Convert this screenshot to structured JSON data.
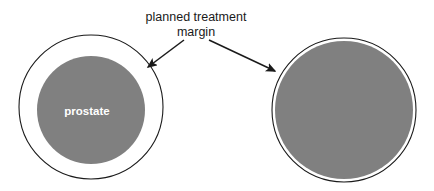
{
  "figure": {
    "background_color": "#ffffff",
    "annotation": {
      "line1": "planned treatment",
      "line2": "margin",
      "color": "#1a1a1a"
    },
    "labels": {
      "prostate": "prostate",
      "prostate_color": "#ffffff"
    },
    "colors": {
      "organ_fill": "#808080",
      "margin_fill": "#ffffff",
      "outline": "#1a1a1a"
    },
    "shapes": {
      "left": {
        "name": "large planned treatment margin around prostate",
        "outer_cx": 91,
        "outer_cy": 107,
        "outer_r": 72,
        "inner_cx": 91,
        "inner_cy": 110,
        "inner_r": 54
      },
      "right": {
        "name": "tight planned treatment margin around prostate",
        "outer_cx": 344,
        "outer_cy": 110,
        "outer_r": 72,
        "inner_cx": 344,
        "inner_cy": 110,
        "inner_r": 69
      }
    },
    "arrows": {
      "left": {
        "x1": 184,
        "y1": 40,
        "x2": 148,
        "y2": 67
      },
      "right": {
        "x1": 209,
        "y1": 40,
        "x2": 275,
        "y2": 71
      }
    }
  }
}
